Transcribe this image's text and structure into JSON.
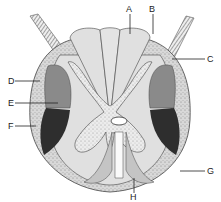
{
  "diagram": {
    "labels": {
      "A": "A",
      "B": "B",
      "C": "C",
      "D": "D",
      "E": "E",
      "F": "F",
      "G": "G",
      "H": "H"
    },
    "colors": {
      "white_matter": "#e0e0e0",
      "gray_matter": "#ececec",
      "outer_tract": "#d4d4d4",
      "mid_tract": "#8a8a8a",
      "dark_tract": "#2e2e2e",
      "outline": "#444444",
      "anterior_band": "#c4c4c4"
    }
  }
}
